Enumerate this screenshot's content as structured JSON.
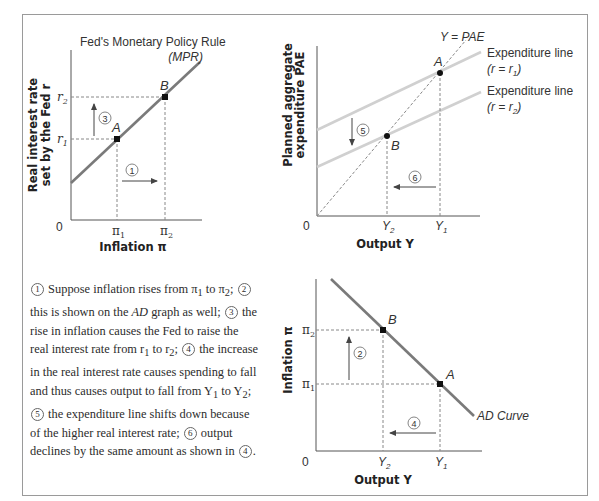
{
  "top_left_chart": {
    "title_line1": "Fed's Monetary Policy Rule",
    "title_line2": "(MPR)",
    "ylabel_line1": "Real interest rate",
    "ylabel_line2": "set by the Fed r",
    "xlabel": "Inflation π",
    "origin": "0",
    "y_ticks": [
      "r",
      "r"
    ],
    "y_tick_subs": [
      "1",
      "2"
    ],
    "x_ticks": [
      "π",
      "π"
    ],
    "x_tick_subs": [
      "1",
      "2"
    ],
    "points": [
      "A",
      "B"
    ],
    "steps": [
      "1",
      "3"
    ]
  },
  "top_right_chart": {
    "line_label": "Y = PAE",
    "exp_line1_label": "Expenditure line",
    "exp_line1_cond": "(r = r",
    "exp_line1_sub": "1",
    "exp_line2_label": "Expenditure line",
    "exp_line2_cond": "(r = r",
    "exp_line2_sub": "2",
    "ylabel_line1": "Planned aggregate",
    "ylabel_line2": "expenditure PAE",
    "xlabel": "Output Y",
    "origin": "0",
    "x_ticks": [
      "Y",
      "Y"
    ],
    "x_tick_subs": [
      "2",
      "1"
    ],
    "points": [
      "A",
      "B"
    ],
    "steps": [
      "5",
      "6"
    ]
  },
  "bottom_right_chart": {
    "curve_label": "AD Curve",
    "ylabel": "Inflation π",
    "xlabel": "Output Y",
    "origin": "0",
    "y_ticks": [
      "π",
      "π"
    ],
    "y_tick_subs": [
      "2",
      "1"
    ],
    "x_ticks": [
      "Y",
      "Y"
    ],
    "x_tick_subs": [
      "2",
      "1"
    ],
    "points": [
      "B",
      "A"
    ],
    "steps": [
      "2",
      "4"
    ]
  },
  "caption": {
    "n1": "1",
    "t1": " Suppose inflation rises from π",
    "s1": "1",
    "t2": " to π",
    "s2": "2",
    "t3": "; ",
    "n2": "2",
    "t4": " this is shown on the ",
    "t4i": "AD",
    "t5": " graph as well; ",
    "n3": "3",
    "t6": " the rise in inflation causes the Fed to raise the real interest rate from r",
    "s3": "1",
    "t7": " to r",
    "s4": "2",
    "t8": "; ",
    "n4": "4",
    "t9": " the increase in the real interest rate causes spending to fall and thus causes output to fall from Y",
    "s5": "1",
    "t10": " to Y",
    "s6": "2",
    "t11": "; ",
    "n5": "5",
    "t12": " the expenditure line shifts down because of the higher real interest rate; ",
    "n6": "6",
    "t13": " output declines by the same amount as shown in ",
    "n7": "4",
    "t14": "."
  },
  "colors": {
    "curve": "#7a7a7a",
    "expenditure_line": "#d0d0d0",
    "axis": "#555555",
    "dashed": "#888888",
    "point": "#111111",
    "frame": "#9a9a9a"
  }
}
